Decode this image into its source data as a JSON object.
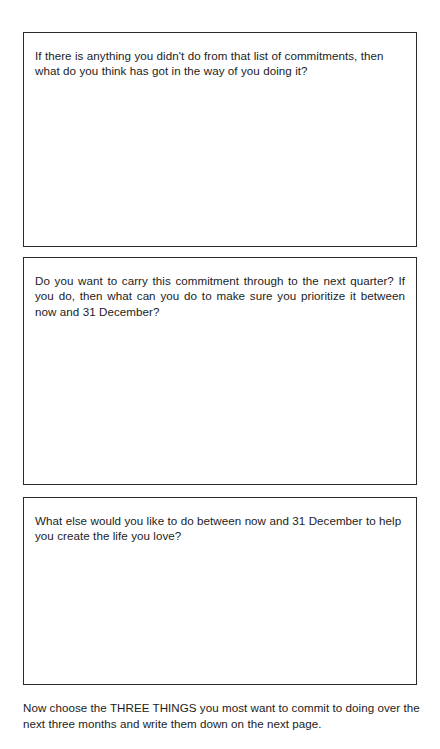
{
  "page": {
    "background_color": "#ffffff",
    "text_color": "#1c1c1c",
    "border_color": "#2b2b2b"
  },
  "boxes": [
    {
      "id": "reflection-obstacles",
      "prompt": "If there is anything you didn't do from that list of commitments, then what do you think has got in the way of you doing it?",
      "align": "left"
    },
    {
      "id": "carry-forward-commitment",
      "prompt": "Do you want to carry this commitment through to the next quarter? If you do, then what can you do to make sure you prioritize it between now and 31 December?",
      "align": "justify"
    },
    {
      "id": "additional-intentions",
      "prompt": "What else would you like to do between now and 31 December to help you create the life you love?",
      "align": "left"
    }
  ],
  "footer": {
    "note": "Now choose the THREE THINGS you most want to commit to doing over the next three months and write them down on the next page."
  }
}
